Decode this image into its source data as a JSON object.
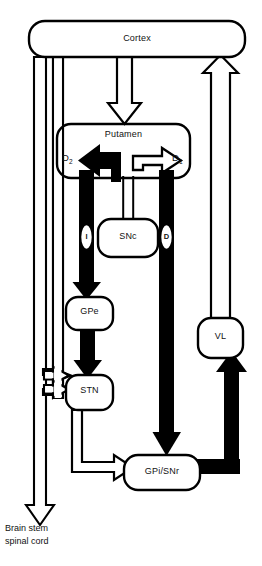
{
  "figure": {
    "kind": "basal-ganglia-circuit-diagram",
    "background_color": "#ffffff",
    "stroke_color": "#000000",
    "excitatory_style": "open/white outlined arrow",
    "inhibitory_style": "solid black arrow"
  },
  "nodes": {
    "cortex": "Cortex",
    "putamen": "Putamen",
    "snc": "SNc",
    "gpe": "GPe",
    "stn": "STN",
    "gpi_snr": "GPi/SNr",
    "vl": "VL"
  },
  "receptors": {
    "d2": "D",
    "d2_sub": "2",
    "d1": "D",
    "d1_sub": "1"
  },
  "pathways": {
    "indirect": "I",
    "direct": "D"
  },
  "output": {
    "line1": "Brain stem",
    "line2": "spinal cord"
  }
}
